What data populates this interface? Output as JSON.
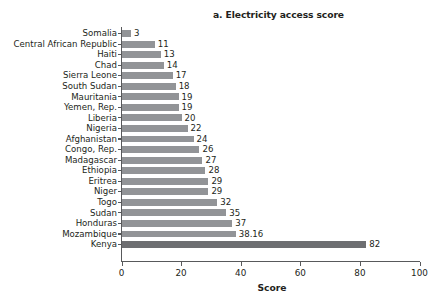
{
  "chart_data": {
    "type": "bar",
    "orientation": "horizontal",
    "title": "a. Electricity access score",
    "xlabel": "Score",
    "ylabel": "",
    "xlim": [
      0,
      100
    ],
    "xticks": [
      0,
      20,
      40,
      60,
      80,
      100
    ],
    "xtick_labels": [
      "0",
      "20",
      "40",
      "60",
      "80",
      "100"
    ],
    "grid": false,
    "legend": null,
    "categories": [
      "Somalia",
      "Central African Republic",
      "Haiti",
      "Chad",
      "Sierra Leone",
      "South Sudan",
      "Mauritania",
      "Yemen, Rep.",
      "Liberia",
      "Nigeria",
      "Afghanistan",
      "Congo, Rep.",
      "Madagascar",
      "Ethiopia",
      "Eritrea",
      "Niger",
      "Togo",
      "Sudan",
      "Honduras",
      "Mozambique",
      "Kenya"
    ],
    "values": [
      3,
      11,
      13,
      14,
      17,
      18,
      19,
      19,
      20,
      22,
      24,
      26,
      27,
      28,
      29,
      29,
      32,
      35,
      37,
      38.16,
      82
    ],
    "value_labels": [
      "3",
      "11",
      "13",
      "14",
      "17",
      "18",
      "19",
      "19",
      "20",
      "22",
      "24",
      "26",
      "27",
      "28",
      "29",
      "29",
      "32",
      "35",
      "37",
      "38.16",
      "82"
    ],
    "highlight_category": "Kenya",
    "colors": {
      "bar": "#929497",
      "bar_highlight": "#6d6e71",
      "axis": "#58595b",
      "text": "#231f20",
      "background": "#ffffff"
    }
  }
}
